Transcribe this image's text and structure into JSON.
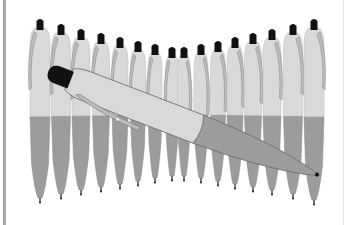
{
  "image": {
    "subject": "Row of retractable ballpoint pens standing upright with one pen lying diagonally across them",
    "colors": {
      "background": "#ffffff",
      "barrel_upper": "#d9d9d9",
      "barrel_lower": "#9c9c9c",
      "clip": "#bdbdbd",
      "cap_button": "#111111",
      "outline": "#6f6f6f",
      "frame_bar": "#a8a8a8"
    },
    "standing_pens": [
      {
        "cx": 40,
        "top": 18,
        "w": 20,
        "bottom": 204
      },
      {
        "cx": 61,
        "top": 23,
        "w": 19,
        "bottom": 200
      },
      {
        "cx": 81,
        "top": 28,
        "w": 18,
        "bottom": 196
      },
      {
        "cx": 101,
        "top": 32,
        "w": 17,
        "bottom": 193
      },
      {
        "cx": 120,
        "top": 36,
        "w": 16,
        "bottom": 190
      },
      {
        "cx": 138,
        "top": 40,
        "w": 15,
        "bottom": 187
      },
      {
        "cx": 155,
        "top": 43,
        "w": 14,
        "bottom": 184
      },
      {
        "cx": 172,
        "top": 46,
        "w": 13,
        "bottom": 182
      },
      {
        "cx": 184,
        "top": 46,
        "w": 13,
        "bottom": 182
      },
      {
        "cx": 201,
        "top": 43,
        "w": 14,
        "bottom": 184
      },
      {
        "cx": 218,
        "top": 40,
        "w": 15,
        "bottom": 187
      },
      {
        "cx": 235,
        "top": 36,
        "w": 16,
        "bottom": 190
      },
      {
        "cx": 253,
        "top": 32,
        "w": 17,
        "bottom": 193
      },
      {
        "cx": 272,
        "top": 28,
        "w": 18,
        "bottom": 196
      },
      {
        "cx": 293,
        "top": 23,
        "w": 19,
        "bottom": 200
      },
      {
        "cx": 314,
        "top": 18,
        "w": 20,
        "bottom": 206
      }
    ],
    "lying_pen": {
      "cap": {
        "x": 52,
        "y": 73
      },
      "tip": {
        "x": 318,
        "y": 175
      }
    }
  }
}
